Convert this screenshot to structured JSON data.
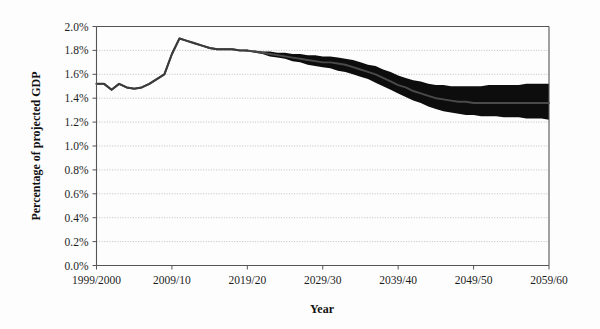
{
  "chart_data": {
    "type": "area",
    "title": "",
    "xlabel": "Year",
    "ylabel": "Percentage of projected GDP",
    "grid": true,
    "legend": "none",
    "xlim": [
      1999,
      2059
    ],
    "ylim": [
      0.0,
      2.0
    ],
    "ytick_values": [
      0.0,
      0.2,
      0.4,
      0.6,
      0.8,
      1.0,
      1.2,
      1.4,
      1.6,
      1.8,
      2.0
    ],
    "ytick_labels": [
      "0.0%",
      "0.2%",
      "0.4%",
      "0.6%",
      "0.8%",
      "1.0%",
      "1.2%",
      "1.4%",
      "1.6%",
      "1.8%",
      "2.0%"
    ],
    "xtick_values": [
      1999,
      2009,
      2019,
      2029,
      2039,
      2049,
      2059
    ],
    "xtick_labels": [
      "1999/2000",
      "2009/10",
      "2019/20",
      "2029/30",
      "2039/40",
      "2049/50",
      "2059/60"
    ],
    "x": [
      1999,
      2000,
      2001,
      2002,
      2003,
      2004,
      2005,
      2006,
      2007,
      2008,
      2009,
      2010,
      2011,
      2012,
      2013,
      2014,
      2015,
      2016,
      2017,
      2018,
      2019,
      2020,
      2021,
      2022,
      2023,
      2024,
      2025,
      2026,
      2027,
      2028,
      2029,
      2030,
      2031,
      2032,
      2033,
      2034,
      2035,
      2036,
      2037,
      2038,
      2039,
      2040,
      2041,
      2042,
      2043,
      2044,
      2045,
      2046,
      2047,
      2048,
      2049,
      2050,
      2051,
      2052,
      2053,
      2054,
      2055,
      2056,
      2057,
      2058,
      2059
    ],
    "series": [
      {
        "name": "Central projection",
        "values": [
          1.52,
          1.52,
          1.47,
          1.52,
          1.49,
          1.48,
          1.49,
          1.52,
          1.56,
          1.6,
          1.77,
          1.9,
          1.88,
          1.86,
          1.84,
          1.82,
          1.81,
          1.81,
          1.81,
          1.8,
          1.8,
          1.79,
          1.78,
          1.77,
          1.76,
          1.75,
          1.74,
          1.73,
          1.72,
          1.71,
          1.7,
          1.7,
          1.69,
          1.68,
          1.66,
          1.64,
          1.62,
          1.6,
          1.57,
          1.54,
          1.51,
          1.49,
          1.46,
          1.44,
          1.42,
          1.4,
          1.39,
          1.38,
          1.37,
          1.37,
          1.36,
          1.36,
          1.36,
          1.36,
          1.36,
          1.36,
          1.36,
          1.36,
          1.36,
          1.36,
          1.36
        ]
      },
      {
        "name": "Uncertainty band upper",
        "values": [
          1.52,
          1.52,
          1.47,
          1.52,
          1.49,
          1.48,
          1.49,
          1.52,
          1.56,
          1.6,
          1.77,
          1.9,
          1.88,
          1.86,
          1.84,
          1.82,
          1.81,
          1.81,
          1.81,
          1.8,
          1.8,
          1.8,
          1.79,
          1.79,
          1.78,
          1.78,
          1.77,
          1.77,
          1.76,
          1.76,
          1.75,
          1.75,
          1.74,
          1.73,
          1.72,
          1.7,
          1.68,
          1.67,
          1.64,
          1.62,
          1.59,
          1.57,
          1.55,
          1.54,
          1.52,
          1.51,
          1.51,
          1.5,
          1.5,
          1.5,
          1.5,
          1.5,
          1.51,
          1.51,
          1.51,
          1.51,
          1.51,
          1.52,
          1.52,
          1.52,
          1.52
        ]
      },
      {
        "name": "Uncertainty band lower",
        "values": [
          1.52,
          1.52,
          1.47,
          1.52,
          1.49,
          1.48,
          1.49,
          1.52,
          1.56,
          1.6,
          1.77,
          1.9,
          1.88,
          1.86,
          1.84,
          1.82,
          1.81,
          1.81,
          1.81,
          1.8,
          1.79,
          1.78,
          1.77,
          1.75,
          1.74,
          1.73,
          1.71,
          1.7,
          1.68,
          1.67,
          1.66,
          1.65,
          1.63,
          1.62,
          1.6,
          1.58,
          1.56,
          1.53,
          1.5,
          1.47,
          1.44,
          1.41,
          1.38,
          1.36,
          1.33,
          1.31,
          1.29,
          1.28,
          1.27,
          1.26,
          1.26,
          1.25,
          1.25,
          1.25,
          1.24,
          1.24,
          1.24,
          1.23,
          1.23,
          1.23,
          1.22
        ]
      }
    ],
    "annotations": []
  },
  "axes": {
    "y_title": "Percentage of projected GDP",
    "x_title": "Year"
  }
}
